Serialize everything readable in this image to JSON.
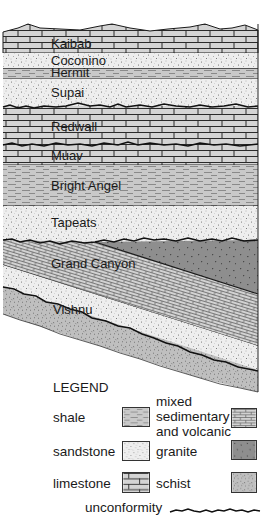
{
  "figure": {
    "layers": [
      {
        "name": "Kaibab",
        "rock": "limestone"
      },
      {
        "name": "Coconino",
        "rock": "sandstone"
      },
      {
        "name": "Hermit",
        "rock": "shale"
      },
      {
        "name": "Supai",
        "rock": "sandstone"
      },
      {
        "name": "Redwall",
        "rock": "limestone"
      },
      {
        "name": "Muav",
        "rock": "limestone"
      },
      {
        "name": "Bright Angel",
        "rock": "shale"
      },
      {
        "name": "Tapeats",
        "rock": "sandstone"
      },
      {
        "name": "Grand Canyon",
        "rock": "mixed sedimentary and volcanic"
      },
      {
        "name": "Vishnu",
        "rock": "schist"
      }
    ],
    "colors": {
      "limestone": "#d4d4d4",
      "sandstone": "#ececec",
      "shale": "#c8c8c8",
      "mixed": "#cfcfcf",
      "granite": "#8c8c8c",
      "schist": "#bdbdbd",
      "line": "#1a1a1a"
    }
  },
  "legend": {
    "title": "LEGEND",
    "items": [
      {
        "label": "shale",
        "pattern": "shale"
      },
      {
        "label_lines": [
          "mixed",
          "sedimentary",
          "and volcanic"
        ],
        "pattern": "mixed"
      },
      {
        "label": "sandstone",
        "pattern": "sandstone"
      },
      {
        "label": "granite",
        "pattern": "granite"
      },
      {
        "label": "limestone",
        "pattern": "limestone"
      },
      {
        "label": "schist",
        "pattern": "schist"
      }
    ],
    "unconformity_label": "unconformity"
  }
}
